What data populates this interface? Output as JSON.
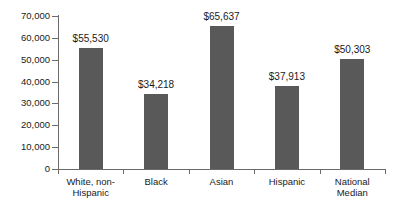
{
  "chart_data": {
    "type": "bar",
    "title": "",
    "subtitle": "",
    "xlabel": "",
    "ylabel": "",
    "categories": [
      "White, non-Hispanic",
      "Black",
      "Asian",
      "Hispanic",
      "National Median"
    ],
    "category_lines": [
      [
        "White, non-",
        "Hispanic"
      ],
      [
        "Black"
      ],
      [
        "Asian"
      ],
      [
        "Hispanic"
      ],
      [
        "National",
        "Median"
      ]
    ],
    "values": [
      55530,
      34218,
      65637,
      37913,
      50303
    ],
    "value_labels": [
      "$55,530",
      "$34,218",
      "$65,637",
      "$37,913",
      "$50,303"
    ],
    "ylim": [
      0,
      70000
    ],
    "ytick_values": [
      0,
      10000,
      20000,
      30000,
      40000,
      50000,
      60000,
      70000
    ],
    "ytick_labels": [
      "0",
      "10,000",
      "20,000",
      "30,000",
      "40,000",
      "50,000",
      "60,000",
      "70,000"
    ],
    "grid": false,
    "legend": null,
    "legend_position": "none",
    "bar_color": "#595959",
    "axis_color": "#6b6b6b",
    "text_color": "#1a1a1a",
    "background_color": "#ffffff"
  }
}
